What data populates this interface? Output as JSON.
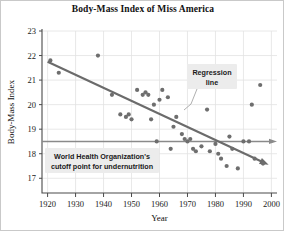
{
  "chart_data": {
    "type": "scatter",
    "title": "Body-Mass Index of Miss America",
    "xlabel": "Year",
    "ylabel": "Body-Mass Index",
    "xlim": [
      1918,
      2002
    ],
    "ylim": [
      16.4,
      23
    ],
    "xticks": [
      1920,
      1930,
      1940,
      1950,
      1960,
      1970,
      1980,
      1990,
      2000
    ],
    "yticks": [
      17,
      18,
      19,
      20,
      21,
      22,
      23
    ],
    "grid": true,
    "legend": "none",
    "points": [
      {
        "x": 1921,
        "y": 21.8
      },
      {
        "x": 1924,
        "y": 21.3
      },
      {
        "x": 1938,
        "y": 22.0
      },
      {
        "x": 1943,
        "y": 20.4
      },
      {
        "x": 1946,
        "y": 19.6
      },
      {
        "x": 1948,
        "y": 19.5
      },
      {
        "x": 1949,
        "y": 19.6
      },
      {
        "x": 1950,
        "y": 19.4
      },
      {
        "x": 1952,
        "y": 20.6
      },
      {
        "x": 1954,
        "y": 20.4
      },
      {
        "x": 1955,
        "y": 20.5
      },
      {
        "x": 1956,
        "y": 20.4
      },
      {
        "x": 1957,
        "y": 19.4
      },
      {
        "x": 1958,
        "y": 20.0
      },
      {
        "x": 1959,
        "y": 18.5
      },
      {
        "x": 1960,
        "y": 20.2
      },
      {
        "x": 1961,
        "y": 20.6
      },
      {
        "x": 1963,
        "y": 20.3
      },
      {
        "x": 1964,
        "y": 18.2
      },
      {
        "x": 1965,
        "y": 19.1
      },
      {
        "x": 1966,
        "y": 19.5
      },
      {
        "x": 1968,
        "y": 18.8
      },
      {
        "x": 1969,
        "y": 18.6
      },
      {
        "x": 1970,
        "y": 18.5
      },
      {
        "x": 1971,
        "y": 18.6
      },
      {
        "x": 1972,
        "y": 18.2
      },
      {
        "x": 1973,
        "y": 18.1
      },
      {
        "x": 1975,
        "y": 18.3
      },
      {
        "x": 1977,
        "y": 19.8
      },
      {
        "x": 1978,
        "y": 18.1
      },
      {
        "x": 1980,
        "y": 18.4
      },
      {
        "x": 1981,
        "y": 18.0
      },
      {
        "x": 1982,
        "y": 17.8
      },
      {
        "x": 1984,
        "y": 17.5
      },
      {
        "x": 1985,
        "y": 18.7
      },
      {
        "x": 1986,
        "y": 18.2
      },
      {
        "x": 1988,
        "y": 17.4
      },
      {
        "x": 1990,
        "y": 18.5
      },
      {
        "x": 1992,
        "y": 18.5
      },
      {
        "x": 1993,
        "y": 20.0
      },
      {
        "x": 1994,
        "y": 17.8
      },
      {
        "x": 1996,
        "y": 20.8
      },
      {
        "x": 1997,
        "y": 17.6
      }
    ],
    "regression_line": {
      "label": "Regression line",
      "x_start": 1920,
      "y_start": 21.75,
      "x_end": 1999,
      "y_end": 17.55,
      "arrow": true
    },
    "reference_line": {
      "label": "World Health Organization's cutoff point for undernutrition",
      "value": 18.5,
      "orientation": "horizontal",
      "arrow": true
    },
    "annotations": [
      {
        "id": "regression-label",
        "text_line1": "Regression",
        "text_line2": "line"
      },
      {
        "id": "who-label",
        "text_line1": "World Health Organization's",
        "text_line2": "cutoff point for undernutrition"
      }
    ],
    "colors": {
      "point": "#6e6e6e",
      "regression_line": "#6b6b6b",
      "reference_line": "#8a8a8a",
      "grid": "#e2e2e2",
      "axis": "#4a4a4a",
      "annotation_box": "#ececec",
      "background": "#ffffff"
    }
  }
}
